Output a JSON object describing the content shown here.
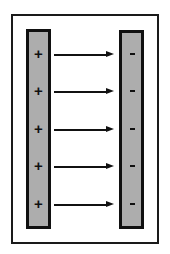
{
  "diagram": {
    "title": "",
    "positive_plate": {
      "label": "positive-plate",
      "charges": [
        "+",
        "+",
        "+",
        "+",
        "+"
      ]
    },
    "negative_plate": {
      "label": "negative-plate",
      "charges": [
        "-",
        "-",
        "-",
        "-",
        "-"
      ]
    },
    "field_lines": {
      "count": 5,
      "direction": "left-to-right",
      "y_positions": [
        54,
        91,
        129,
        166,
        204
      ]
    },
    "colors": {
      "plate_fill": "#adadad",
      "plate_border": "#111111",
      "frame_border": "#1a1a1a",
      "arrow": "#111111",
      "background": "#ffffff"
    }
  }
}
